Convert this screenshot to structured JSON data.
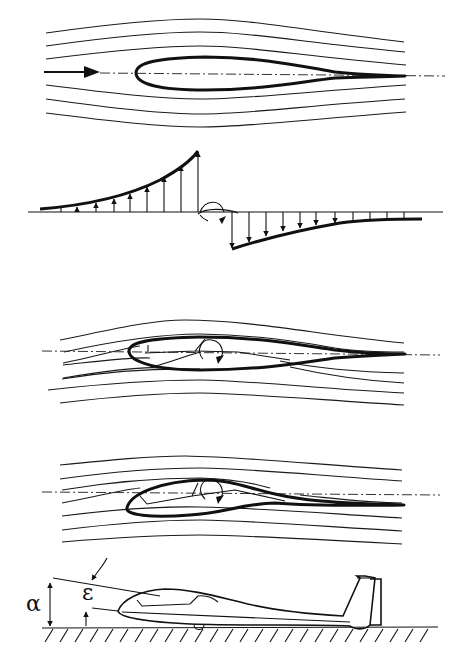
{
  "diagram": {
    "panels": [
      {
        "id": "symmetric-body-flow",
        "description": "Streamlines around a symmetric teardrop body at zero incidence with flow direction arrow and dash-dot centerline",
        "streamlines_above": 3,
        "streamlines_below": 3
      },
      {
        "id": "pressure-distribution",
        "description": "Lift distribution along span/length: upward arrows increasing toward center on left, downward arrows decaying on right, with rotation symbol at center",
        "up_arrows": 9,
        "down_arrows": 11
      },
      {
        "id": "inclined-body-flow",
        "description": "Streamlines around the body with a glider silhouette inside; rotation arrow indicates pitching moment",
        "streamlines_above": 3,
        "streamlines_below": 4
      },
      {
        "id": "cambered-body-flow",
        "description": "Streamlines around a cambered glider fuselage shape with rotation arrow",
        "streamlines_above": 3,
        "streamlines_below": 4
      },
      {
        "id": "glider-on-ground",
        "description": "Side view of a glider resting on the ground with angles annotated",
        "labels": {
          "alpha": "α",
          "epsilon": "ε"
        }
      }
    ],
    "colors": {
      "background": "#ffffff",
      "ink": "#111111"
    }
  }
}
